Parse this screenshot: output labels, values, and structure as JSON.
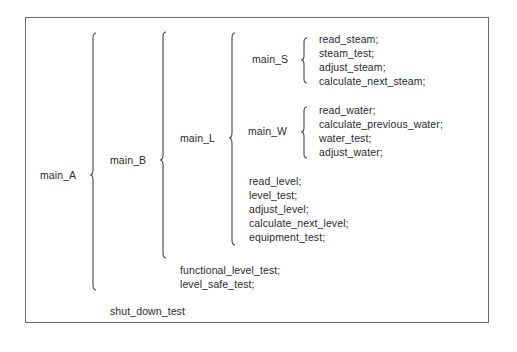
{
  "diagram": {
    "type": "decomposition-tree",
    "root": {
      "label": "main_A",
      "children": [
        {
          "label": "main_B",
          "children": [
            {
              "label": "main_L",
              "children": [
                {
                  "label": "main_S",
                  "children": [
                    "read_steam;",
                    "steam_test;",
                    "adjust_steam;",
                    "calculate_next_steam;"
                  ]
                },
                {
                  "label": "main_W",
                  "children": [
                    "read_water;",
                    "calculate_previous_water;",
                    "water_test;",
                    "adjust_water;"
                  ]
                },
                "read_level;",
                "level_test;",
                "adjust_level;",
                "calculate_next_level;",
                "equipment_test;"
              ]
            },
            "functional_level_test;",
            "level_safe_test;"
          ]
        },
        "shut_down_test"
      ]
    }
  },
  "labels": {
    "main_A": "main_A",
    "main_B": "main_B",
    "main_L": "main_L",
    "main_S": "main_S",
    "main_W": "main_W",
    "steam": [
      "read_steam;",
      "steam_test;",
      "adjust_steam;",
      "calculate_next_steam;"
    ],
    "water": [
      "read_water;",
      "calculate_previous_water;",
      "water_test;",
      "adjust_water;"
    ],
    "level": [
      "read_level;",
      "level_test;",
      "adjust_level;",
      "calculate_next_level;",
      "equipment_test;"
    ],
    "b_tail": [
      "functional_level_test;",
      "level_safe_test;"
    ],
    "a_tail": "shut_down_test"
  }
}
